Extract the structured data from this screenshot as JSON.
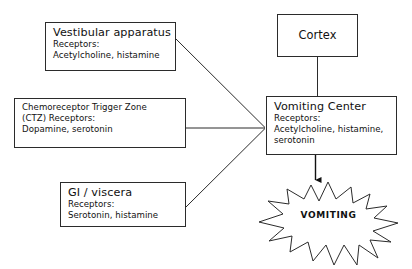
{
  "diagram": {
    "stroke_color": "#2b2b2b",
    "text_color": "#111111",
    "background_color": "#ffffff",
    "nodes": [
      {
        "id": "vestibular",
        "title": "Vestibular apparatus",
        "line2": "Receptors:",
        "line3": "Acetylcholine, histamine"
      },
      {
        "id": "ctz",
        "title": "Chemoreceptor Trigger Zone",
        "line2": "(CTZ) Receptors:",
        "line3": "Dopamine, serotonin"
      },
      {
        "id": "gi",
        "title": "GI / viscera",
        "line2": "Receptors:",
        "line3": "Serotonin, histamine"
      },
      {
        "id": "cortex",
        "title": "Cortex"
      },
      {
        "id": "vomiting_center",
        "title": "Vomiting Center",
        "line2": "Receptors:",
        "line3": "Acetylcholine, histamine,",
        "line4": "serotonin"
      }
    ],
    "outcome": {
      "label": "VOMITING",
      "shape": "starburst"
    },
    "connectors": [
      {
        "from": "vestibular",
        "to": "vomiting_center",
        "style": "diagonal-line"
      },
      {
        "from": "ctz",
        "to": "vomiting_center",
        "style": "horizontal-line"
      },
      {
        "from": "gi",
        "to": "vomiting_center",
        "style": "diagonal-line"
      },
      {
        "from": "cortex",
        "to": "vomiting_center",
        "style": "vertical-line"
      },
      {
        "from": "vomiting_center",
        "to": "outcome",
        "style": "vertical-arrow"
      }
    ]
  }
}
